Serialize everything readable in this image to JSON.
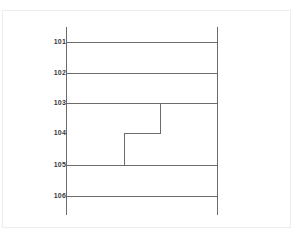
{
  "figure": {
    "type": "ladder-diagram",
    "background_color": "#ffffff",
    "frame_color": "#ededed",
    "line_color": "#6b6b6b",
    "label_color": "#3a3a3a"
  },
  "axis": {
    "left_rail": {
      "x": 66,
      "y_top": 27,
      "y_bottom": 215
    },
    "right_rail": {
      "x": 217,
      "y_top": 27,
      "y_bottom": 215
    }
  },
  "rows": [
    {
      "label": "101",
      "y": 42,
      "rung": true,
      "label_x": 40,
      "label_y": 38
    },
    {
      "label": "102",
      "y": 73,
      "rung": true,
      "label_x": 40,
      "label_y": 69
    },
    {
      "label": "103",
      "y": 103,
      "rung": true,
      "label_x": 40,
      "label_y": 99
    },
    {
      "label": "104",
      "y": 133,
      "rung": false,
      "label_x": 40,
      "label_y": 129
    },
    {
      "label": "105",
      "y": 165,
      "rung": true,
      "label_x": 40,
      "label_y": 161
    },
    {
      "label": "106",
      "y": 196,
      "rung": true,
      "label_x": 40,
      "label_y": 192
    }
  ],
  "step_path": {
    "description": "staircase between rows 103 and 105",
    "vertical_right": {
      "x": 160,
      "y_start": 103,
      "y_end": 133
    },
    "horizontal_mid": {
      "y": 133,
      "x_start": 124,
      "x_end": 160
    },
    "vertical_left": {
      "x": 124,
      "y_start": 133,
      "y_end": 165
    }
  },
  "chart_data": {
    "type": "line",
    "title": "",
    "xlabel": "",
    "ylabel": "",
    "categories": [
      "101",
      "102",
      "103",
      "104",
      "105",
      "106"
    ],
    "series": [
      {
        "name": "horizontal-rungs",
        "rows": [
          "101",
          "102",
          "103",
          "105",
          "106"
        ],
        "values": [
          1,
          1,
          1,
          0,
          1,
          1
        ]
      },
      {
        "name": "step-path",
        "points": [
          {
            "x": 160,
            "row": "103"
          },
          {
            "x": 160,
            "row": "104"
          },
          {
            "x": 124,
            "row": "104"
          },
          {
            "x": 124,
            "row": "105"
          }
        ]
      }
    ],
    "grid": false,
    "legend": "none"
  }
}
